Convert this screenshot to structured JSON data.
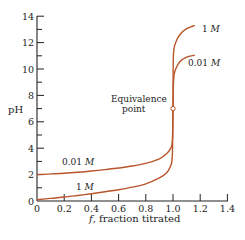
{
  "chart_data": {
    "type": "line",
    "title": "",
    "xlabel_italic": "f",
    "xlabel_rest": ", fraction titrated",
    "xlabel": "f, fraction titrated",
    "ylabel": "pH",
    "xlim": [
      0,
      1.4
    ],
    "ylim": [
      0,
      14
    ],
    "grid": false,
    "legend": "none (inline labels)",
    "x_ticks": [
      "0",
      "0.2",
      "0.4",
      "0.6",
      "0.8",
      "1.0",
      "1.2",
      "1.4"
    ],
    "y_ticks": [
      "0",
      "2",
      "4",
      "6",
      "8",
      "10",
      "12",
      "14"
    ],
    "line_color": "#b8552a",
    "series": [
      {
        "name": "0.01 M",
        "label_unit": "M",
        "label_num": "0.01",
        "points": [
          [
            0.0,
            2.0
          ],
          [
            0.1,
            2.05
          ],
          [
            0.2,
            2.1
          ],
          [
            0.3,
            2.18
          ],
          [
            0.4,
            2.27
          ],
          [
            0.5,
            2.38
          ],
          [
            0.6,
            2.5
          ],
          [
            0.7,
            2.65
          ],
          [
            0.8,
            2.85
          ],
          [
            0.9,
            3.2
          ],
          [
            0.95,
            3.55
          ],
          [
            0.98,
            3.95
          ],
          [
            0.995,
            4.5
          ],
          [
            1.0,
            7.0
          ],
          [
            1.005,
            9.3
          ],
          [
            1.02,
            10.0
          ],
          [
            1.05,
            10.55
          ],
          [
            1.1,
            10.9
          ],
          [
            1.16,
            11.05
          ]
        ]
      },
      {
        "name": "1 M",
        "label_unit": "M",
        "label_num": "1",
        "points": [
          [
            0.0,
            0.1
          ],
          [
            0.1,
            0.2
          ],
          [
            0.2,
            0.3
          ],
          [
            0.3,
            0.42
          ],
          [
            0.4,
            0.55
          ],
          [
            0.5,
            0.7
          ],
          [
            0.6,
            0.85
          ],
          [
            0.7,
            1.05
          ],
          [
            0.8,
            1.3
          ],
          [
            0.9,
            1.75
          ],
          [
            0.95,
            2.1
          ],
          [
            0.98,
            2.6
          ],
          [
            0.995,
            3.4
          ],
          [
            1.0,
            7.0
          ],
          [
            1.003,
            11.0
          ],
          [
            1.02,
            12.0
          ],
          [
            1.05,
            12.6
          ],
          [
            1.1,
            13.05
          ],
          [
            1.16,
            13.3
          ]
        ]
      }
    ],
    "annotations": [
      {
        "text_line1": "Equivalence",
        "text_line2": "point",
        "x": 1.0,
        "y": 7.0,
        "marker": "open-circle"
      }
    ]
  }
}
